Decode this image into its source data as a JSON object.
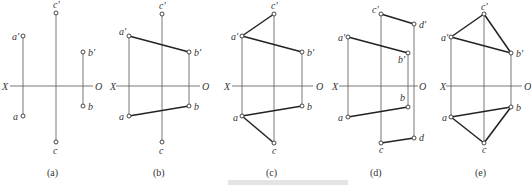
{
  "figure": {
    "caption_text": "",
    "axis_labels": {
      "left": "X",
      "right": "O"
    },
    "panels": [
      {
        "id": "a",
        "label": "(a)",
        "axis": {
          "x1": 10,
          "x2": 93,
          "y": 86,
          "xlab_x": 2,
          "olab_x": 95
        },
        "points": [
          {
            "name": "a'",
            "x": 23,
            "y": 36,
            "lx": 12,
            "ly": 40
          },
          {
            "name": "a",
            "x": 23,
            "y": 116,
            "lx": 13,
            "ly": 120
          },
          {
            "name": "c'",
            "x": 56,
            "y": 13,
            "lx": 53,
            "ly": 8
          },
          {
            "name": "c",
            "x": 56,
            "y": 142,
            "lx": 53,
            "ly": 154
          },
          {
            "name": "b'",
            "x": 83,
            "y": 52,
            "lx": 88,
            "ly": 56
          },
          {
            "name": "b",
            "x": 83,
            "y": 106,
            "lx": 88,
            "ly": 110
          }
        ],
        "projectors": [
          [
            "a'",
            "a"
          ],
          [
            "c'",
            "c"
          ],
          [
            "b'",
            "b"
          ]
        ],
        "edges": [],
        "label_pos": {
          "x": 47,
          "y": 176
        }
      },
      {
        "id": "b",
        "label": "(b)",
        "axis": {
          "x1": 116,
          "x2": 200,
          "y": 86,
          "xlab_x": 110,
          "olab_x": 202
        },
        "points": [
          {
            "name": "a'",
            "x": 129,
            "y": 36,
            "lx": 119,
            "ly": 35
          },
          {
            "name": "a",
            "x": 129,
            "y": 116,
            "lx": 119,
            "ly": 120
          },
          {
            "name": "c'",
            "x": 162,
            "y": 14,
            "lx": 159,
            "ly": 9
          },
          {
            "name": "c",
            "x": 162,
            "y": 142,
            "lx": 159,
            "ly": 154
          },
          {
            "name": "b'",
            "x": 189,
            "y": 52,
            "lx": 194,
            "ly": 56
          },
          {
            "name": "b",
            "x": 189,
            "y": 106,
            "lx": 194,
            "ly": 110
          }
        ],
        "projectors": [
          [
            "a'",
            "a"
          ],
          [
            "c'",
            "c"
          ],
          [
            "b'",
            "b"
          ]
        ],
        "edges": [
          [
            "a'",
            "b'"
          ],
          [
            "a",
            "b"
          ]
        ],
        "label_pos": {
          "x": 153,
          "y": 176
        }
      },
      {
        "id": "c",
        "label": "(c)",
        "axis": {
          "x1": 232,
          "x2": 313,
          "y": 86,
          "xlab_x": 224,
          "olab_x": 316
        },
        "points": [
          {
            "name": "a'",
            "x": 242,
            "y": 36,
            "lx": 231,
            "ly": 40
          },
          {
            "name": "a",
            "x": 242,
            "y": 116,
            "lx": 233,
            "ly": 121
          },
          {
            "name": "c'",
            "x": 274,
            "y": 14,
            "lx": 271,
            "ly": 9
          },
          {
            "name": "c",
            "x": 274,
            "y": 143,
            "lx": 272,
            "ly": 154
          },
          {
            "name": "b'",
            "x": 302,
            "y": 52,
            "lx": 307,
            "ly": 56
          },
          {
            "name": "b",
            "x": 302,
            "y": 106,
            "lx": 307,
            "ly": 110
          }
        ],
        "projectors": [
          [
            "a'",
            "a"
          ],
          [
            "c'",
            "c"
          ],
          [
            "b'",
            "b"
          ]
        ],
        "edges": [
          [
            "a'",
            "b'"
          ],
          [
            "a",
            "b"
          ],
          [
            "a'",
            "c'"
          ],
          [
            "a",
            "c"
          ]
        ],
        "label_pos": {
          "x": 266,
          "y": 176
        }
      },
      {
        "id": "d",
        "label": "(d)",
        "axis": {
          "x1": 339,
          "x2": 418,
          "y": 86,
          "xlab_x": 332,
          "olab_x": 419
        },
        "points": [
          {
            "name": "a'",
            "x": 348,
            "y": 37,
            "lx": 338,
            "ly": 41
          },
          {
            "name": "a",
            "x": 348,
            "y": 117,
            "lx": 338,
            "ly": 121
          },
          {
            "name": "c'",
            "x": 381,
            "y": 14,
            "lx": 372,
            "ly": 13
          },
          {
            "name": "c",
            "x": 381,
            "y": 143,
            "lx": 379,
            "ly": 153
          },
          {
            "name": "b'",
            "x": 408,
            "y": 53,
            "lx": 398,
            "ly": 63
          },
          {
            "name": "b",
            "x": 408,
            "y": 107,
            "lx": 400,
            "ly": 101
          },
          {
            "name": "d'",
            "x": 414,
            "y": 24,
            "lx": 419,
            "ly": 28
          },
          {
            "name": "d",
            "x": 414,
            "y": 138,
            "lx": 419,
            "ly": 141
          }
        ],
        "projectors": [
          [
            "a'",
            "a"
          ],
          [
            "c'",
            "c"
          ],
          [
            "b'",
            "b"
          ],
          [
            "d'",
            "d"
          ]
        ],
        "edges": [
          [
            "a'",
            "b'"
          ],
          [
            "a",
            "b"
          ],
          [
            "c'",
            "d'"
          ],
          [
            "c",
            "d"
          ]
        ],
        "label_pos": {
          "x": 370,
          "y": 176
        }
      },
      {
        "id": "e",
        "label": "(e)",
        "axis": {
          "x1": 446,
          "x2": 522,
          "y": 86,
          "xlab_x": 440,
          "olab_x": 524
        },
        "points": [
          {
            "name": "a'",
            "x": 451,
            "y": 37,
            "lx": 441,
            "ly": 41
          },
          {
            "name": "a",
            "x": 451,
            "y": 117,
            "lx": 442,
            "ly": 121
          },
          {
            "name": "c'",
            "x": 484,
            "y": 14,
            "lx": 481,
            "ly": 10
          },
          {
            "name": "c",
            "x": 484,
            "y": 143,
            "lx": 482,
            "ly": 153
          },
          {
            "name": "b'",
            "x": 511,
            "y": 53,
            "lx": 516,
            "ly": 57
          },
          {
            "name": "b",
            "x": 511,
            "y": 107,
            "lx": 516,
            "ly": 111
          }
        ],
        "projectors": [
          [
            "a'",
            "a"
          ],
          [
            "c'",
            "c"
          ],
          [
            "b'",
            "b"
          ]
        ],
        "edges": [
          [
            "a'",
            "b'"
          ],
          [
            "a",
            "b"
          ],
          [
            "a'",
            "c'"
          ],
          [
            "a",
            "c"
          ],
          [
            "c'",
            "b'"
          ],
          [
            "c",
            "b"
          ]
        ],
        "label_pos": {
          "x": 475,
          "y": 176
        }
      }
    ]
  }
}
